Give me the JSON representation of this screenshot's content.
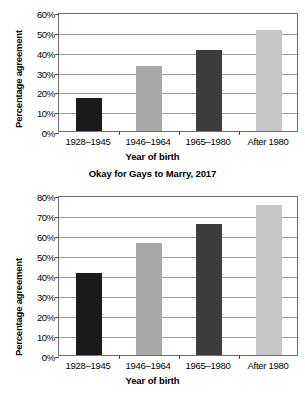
{
  "figure": {
    "background": "#ffffff",
    "axis_color": "#6f6f6f",
    "grid_color": "#9a9a9a"
  },
  "chart_data": [
    {
      "id": "top",
      "type": "bar",
      "title": "",
      "xlabel": "Year of birth",
      "ylabel": "Percentage agreement",
      "categories": [
        "1928–1945",
        "1946–1964",
        "1965–1980",
        "After 1980"
      ],
      "values": [
        16.5,
        33,
        41,
        51
      ],
      "tick_labels": [
        "0%",
        "10%",
        "20%",
        "30%",
        "40%",
        "50%",
        "60%"
      ],
      "ticks": [
        0,
        10,
        20,
        30,
        40,
        50,
        60
      ],
      "ylim": [
        0,
        60
      ],
      "grid": true,
      "legend": "none",
      "bar_colors": [
        "#1a1a1a",
        "#a8a8a8",
        "#3d3d3d",
        "#c6c6c6"
      ]
    },
    {
      "id": "bottom",
      "type": "bar",
      "title": "Okay for Gays to Marry, 2017",
      "xlabel": "Year of birth",
      "ylabel": "Percentage agreement",
      "categories": [
        "1928–1945",
        "1946–1964",
        "1965–1980",
        "After 1980"
      ],
      "values": [
        41,
        56,
        65.5,
        75
      ],
      "tick_labels": [
        "0%",
        "10%",
        "20%",
        "30%",
        "40%",
        "50%",
        "60%",
        "70%",
        "80%"
      ],
      "ticks": [
        0,
        10,
        20,
        30,
        40,
        50,
        60,
        70,
        80
      ],
      "ylim": [
        0,
        80
      ],
      "grid": true,
      "legend": "none",
      "bar_colors": [
        "#1a1a1a",
        "#a8a8a8",
        "#3d3d3d",
        "#c6c6c6"
      ]
    }
  ]
}
